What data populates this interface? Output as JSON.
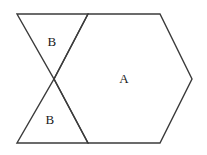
{
  "figure": {
    "width": 207,
    "height": 155,
    "background_color": "#ffffff",
    "stroke_color": "#3b3b3b",
    "stroke_width": 1.4,
    "fill": "none",
    "labels": [
      {
        "text": "B",
        "x": 52,
        "y": 41,
        "name": "region-label-b-top"
      },
      {
        "text": "A",
        "x": 124,
        "y": 78,
        "name": "region-label-a"
      },
      {
        "text": "B",
        "x": 50,
        "y": 119,
        "name": "region-label-b-bottom"
      }
    ],
    "vertices": {
      "top_left": [
        17,
        14
      ],
      "top_mid": [
        88,
        14
      ],
      "top_right": [
        160,
        14
      ],
      "right_point": [
        192,
        79
      ],
      "bottom_right": [
        160,
        143
      ],
      "bottom_mid": [
        88,
        143
      ],
      "bottom_left": [
        17,
        143
      ],
      "center_cross": [
        54,
        79
      ]
    },
    "paths": {
      "hexagon_a": "M 88,14 L 160,14 L 192,79 L 160,143 L 88,143 L 54,79 Z",
      "triangle_b_top": "M 17,14 L 88,14 L 54,79 Z",
      "triangle_b_bottom": "M 17,143 L 88,143 L 54,79 Z"
    }
  }
}
